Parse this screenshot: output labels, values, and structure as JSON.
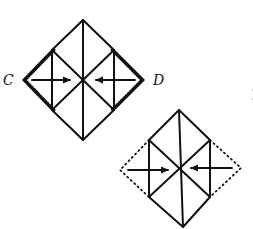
{
  "diagram": {
    "type": "origami-fold-instructions",
    "colors": {
      "stroke": "#111111",
      "background": "#ffffff"
    },
    "step1": {
      "labels": {
        "left_corner": "C",
        "right_corner": "D"
      },
      "description": "Fold corners C and D to the center along the dotted/serrated edges",
      "arrows": [
        "arrow-left-to-center",
        "arrow-right-to-center"
      ]
    },
    "step2": {
      "description": "Result: corners folded in; dotted lines show original outline",
      "arrows": [
        "arrow-left-to-center",
        "arrow-right-to-center"
      ]
    }
  }
}
